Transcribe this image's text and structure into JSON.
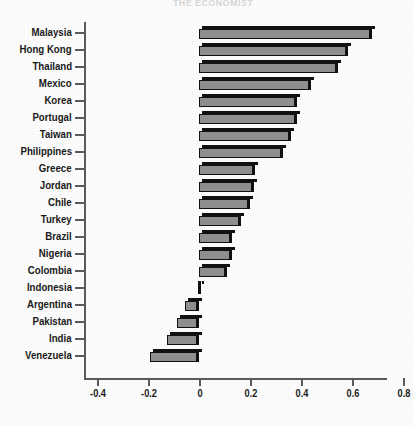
{
  "ghost_header": "THE ECONOMIST",
  "axis": {
    "x_ticks": [
      "-0.4",
      "-0.2",
      "0",
      "0.2",
      "0.4",
      "0.6",
      "0.8"
    ],
    "x_tick_values": [
      -0.4,
      -0.2,
      0,
      0.2,
      0.4,
      0.6,
      0.8
    ],
    "x_min": -0.45,
    "x_max": 0.84
  },
  "chart_data": {
    "type": "bar",
    "orientation": "horizontal",
    "title": "",
    "subtitle": "",
    "xlabel": "",
    "ylabel": "",
    "xlim": [
      -0.45,
      0.84
    ],
    "grid": false,
    "legend": "none",
    "categories": [
      "Malaysia",
      "Hong Kong",
      "Thailand",
      "Mexico",
      "Korea",
      "Portugal",
      "Taiwan",
      "Philippines",
      "Greece",
      "Jordan",
      "Chile",
      "Turkey",
      "Brazil",
      "Nigeria",
      "Colombia",
      "Indonesia",
      "Argentina",
      "Pakistan",
      "India",
      "Venezuela"
    ],
    "values": [
      0.68,
      0.585,
      0.545,
      0.44,
      0.385,
      0.385,
      0.36,
      0.33,
      0.22,
      0.215,
      0.2,
      0.165,
      0.13,
      0.13,
      0.11,
      0.01,
      -0.055,
      -0.085,
      -0.125,
      -0.19
    ],
    "tick_labels": [
      "-0.4",
      "-0.2",
      "0",
      "0.2",
      "0.4",
      "0.6",
      "0.8"
    ]
  },
  "colors": {
    "bar_face": "#8e8e8e",
    "bar_edge": "#111111",
    "axis": "#5a5a5a",
    "text": "#1a1a1a",
    "background": "#fdfdfd"
  }
}
